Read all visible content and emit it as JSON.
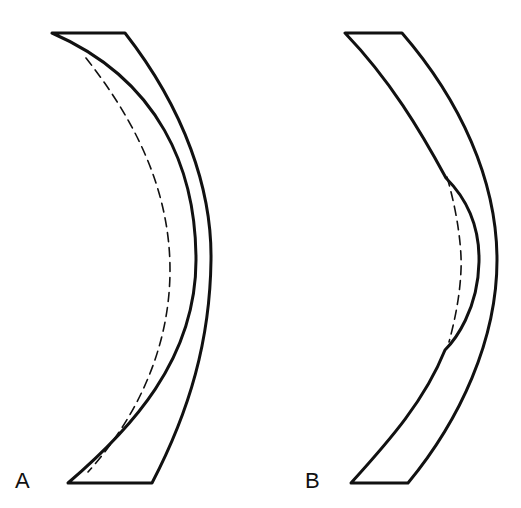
{
  "figure": {
    "panels": [
      {
        "label": "A",
        "description": "Curved shell cross-section with inner surface and dashed reference curve; inner contour displaced along full length",
        "stroke_color": "#111111",
        "dashed_curve": true
      },
      {
        "label": "B",
        "description": "Curved shell cross-section with localized inward bulge on inner surface; dashed reference curve marks original contour",
        "stroke_color": "#111111",
        "dashed_curve": true
      }
    ]
  }
}
